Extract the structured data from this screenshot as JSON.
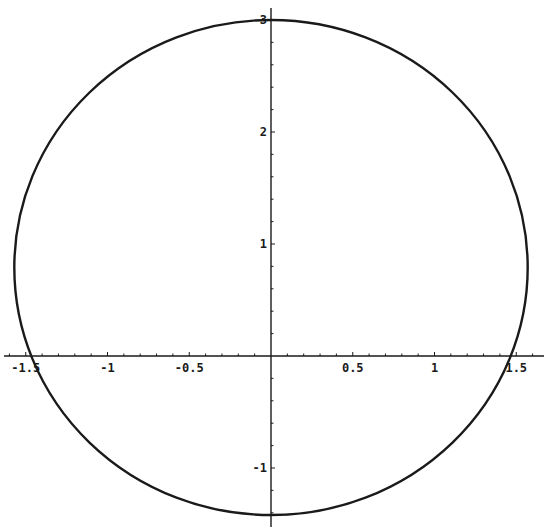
{
  "chart_data": {
    "type": "line",
    "title": "",
    "xlabel": "",
    "ylabel": "",
    "xlim": [
      -1.62,
      1.68
    ],
    "ylim": [
      -1.42,
      3.1
    ],
    "grid": false,
    "legend": null,
    "axes_origin": [
      0,
      0
    ],
    "x_ticks": [
      -1.5,
      -1,
      -0.5,
      0.5,
      1,
      1.5
    ],
    "x_tick_labels": [
      "-1.5",
      "-1",
      "-0.5",
      "0.5",
      "1",
      "1.5"
    ],
    "y_ticks": [
      -1,
      1,
      2,
      3
    ],
    "y_tick_labels": [
      "-1",
      "1",
      "2",
      "3"
    ],
    "series": [
      {
        "name": "closed curve",
        "shape": "ellipse",
        "center": [
          0,
          0.79
        ],
        "semi_axis_x": 1.57,
        "semi_axis_y": 2.21,
        "extents": {
          "xmin": -1.57,
          "xmax": 1.57,
          "ymin": -1.42,
          "ymax": 3.0
        },
        "axis_crossings": {
          "x_axis": [
            -1.45,
            1.45
          ],
          "y_axis": [
            -1.42,
            3.0
          ]
        },
        "color": "#1a1a1a"
      }
    ]
  },
  "axes": {
    "color": "#1a1a1a",
    "px_origin": [
      271,
      356
    ],
    "px_per_unit_x": 163.5,
    "px_per_unit_y": 112
  }
}
